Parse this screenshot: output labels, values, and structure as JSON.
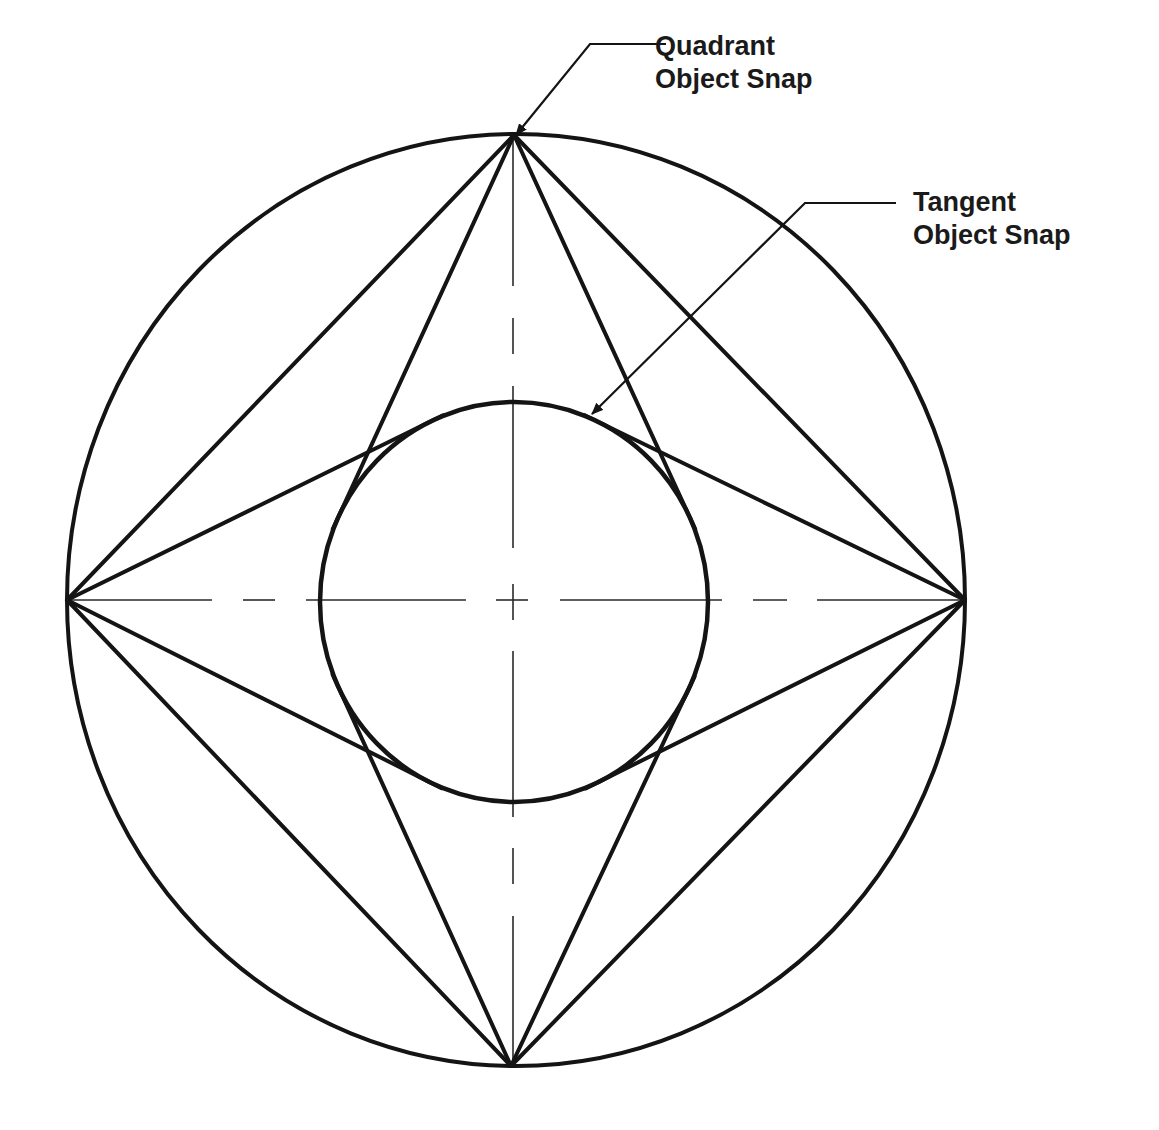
{
  "diagram": {
    "colors": {
      "stroke": "#141414",
      "centerline": "#2a2a2a",
      "background": "#ffffff",
      "text": "#1a1a1a"
    },
    "outer_circle": {
      "cx": 516,
      "cy": 600,
      "rx": 449,
      "ry": 466,
      "stroke_width": 4
    },
    "inner_circle": {
      "cx": 514,
      "cy": 602,
      "rx": 194,
      "ry": 200,
      "stroke_width": 4.5
    },
    "quadrant_points": [
      {
        "name": "top",
        "x": 514,
        "y": 135
      },
      {
        "name": "right",
        "x": 965,
        "y": 600
      },
      {
        "name": "bottom",
        "x": 511,
        "y": 1066
      },
      {
        "name": "left",
        "x": 67,
        "y": 600
      }
    ],
    "line_stroke_width": 4,
    "tangent_overshoot": 14,
    "centerlines": {
      "horizontal": [
        {
          "x1": 67,
          "x2": 212
        },
        {
          "x1": 243,
          "x2": 275
        },
        {
          "x1": 306,
          "x2": 466
        },
        {
          "x1": 496,
          "x2": 528
        },
        {
          "x1": 560,
          "x2": 722
        },
        {
          "x1": 753,
          "x2": 787
        },
        {
          "x1": 817,
          "x2": 965
        }
      ],
      "horizontal_y": 600,
      "vertical": [
        {
          "y1": 135,
          "y2": 286
        },
        {
          "y1": 318,
          "y2": 354
        },
        {
          "y1": 386,
          "y2": 548
        },
        {
          "y1": 584,
          "y2": 620
        },
        {
          "y1": 651,
          "y2": 817
        },
        {
          "y1": 848,
          "y2": 884
        },
        {
          "y1": 916,
          "y2": 1066
        }
      ],
      "vertical_x": 513,
      "stroke_width": 1.6
    },
    "callouts": [
      {
        "id": "quadrant",
        "lines": [
          "Quadrant",
          "Object Snap"
        ],
        "label_x": 655,
        "label_y": 30,
        "leader": [
          [
            666,
            44
          ],
          [
            590,
            44
          ],
          [
            516,
            135
          ]
        ]
      },
      {
        "id": "tangent",
        "lines": [
          "Tangent",
          "Object Snap"
        ],
        "label_x": 913,
        "label_y": 186,
        "leader": [
          [
            896,
            203
          ],
          [
            805,
            203
          ],
          [
            592,
            414
          ]
        ]
      }
    ]
  }
}
